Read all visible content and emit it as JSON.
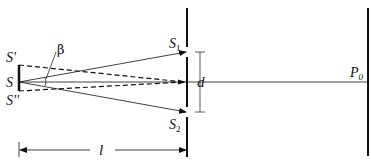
{
  "diagram": {
    "labels": {
      "source_top": "S'",
      "source_center": "S",
      "source_bottom": "S''",
      "slit_top": "S",
      "slit_top_sub": "1",
      "slit_bottom": "S",
      "slit_bottom_sub": "2",
      "slit_separation": "d",
      "angle": "β",
      "screen_point": "P",
      "screen_point_sub": "0",
      "source_distance": "l"
    },
    "colors": {
      "stroke": "#111111",
      "background": "#ffffff"
    }
  }
}
